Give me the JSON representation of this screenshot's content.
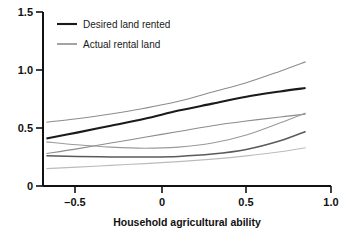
{
  "chart_data": {
    "type": "line",
    "title": "",
    "xlabel": "Household agricultural ability",
    "ylabel": "",
    "xlim": [
      -0.7,
      1.0
    ],
    "ylim": [
      0,
      1.5
    ],
    "xticks": [
      -0.5,
      0,
      0.5,
      1.0
    ],
    "xtick_labels": [
      "–0.5",
      "0",
      "0.5",
      "1.0"
    ],
    "yticks": [
      0,
      0.5,
      1.0,
      1.5
    ],
    "ytick_labels": [
      "0",
      "0.5",
      "1.0",
      "1.5"
    ],
    "grid": false,
    "legend_position": "top-left",
    "x": [
      -0.68,
      -0.5,
      -0.3,
      -0.1,
      0.1,
      0.3,
      0.5,
      0.7,
      0.85
    ],
    "series": [
      {
        "name": "Desired land rented",
        "color": "#1a1a1a",
        "role": "fit",
        "values": [
          0.41,
          0.46,
          0.52,
          0.58,
          0.65,
          0.71,
          0.77,
          0.815,
          0.845
        ]
      },
      {
        "name": "Desired land rented upper CI",
        "color": "#8c8c8c",
        "role": "ci-upper",
        "values": [
          0.55,
          0.58,
          0.62,
          0.67,
          0.73,
          0.81,
          0.89,
          0.99,
          1.07
        ]
      },
      {
        "name": "Desired land rented lower CI",
        "color": "#8c8c8c",
        "role": "ci-lower",
        "values": [
          0.28,
          0.32,
          0.37,
          0.42,
          0.47,
          0.52,
          0.56,
          0.595,
          0.62
        ]
      },
      {
        "name": "Actual rental land",
        "color": "#5a5a5a",
        "role": "fit",
        "values": [
          0.26,
          0.255,
          0.25,
          0.25,
          0.255,
          0.275,
          0.315,
          0.39,
          0.47
        ]
      },
      {
        "name": "Actual rental land upper CI",
        "color": "#9a9a9a",
        "role": "ci-upper",
        "values": [
          0.38,
          0.355,
          0.335,
          0.325,
          0.335,
          0.37,
          0.44,
          0.545,
          0.63
        ]
      },
      {
        "name": "Actual rental land lower CI",
        "color": "#bbbbbb",
        "role": "ci-lower",
        "values": [
          0.15,
          0.163,
          0.178,
          0.193,
          0.21,
          0.232,
          0.26,
          0.295,
          0.33
        ]
      }
    ],
    "legend": [
      {
        "label": "Desired land rented",
        "color": "#1a1a1a"
      },
      {
        "label": "Actual rental land",
        "color": "#8c8c8c"
      }
    ]
  },
  "axis": {
    "x_title": "Household agricultural ability"
  }
}
